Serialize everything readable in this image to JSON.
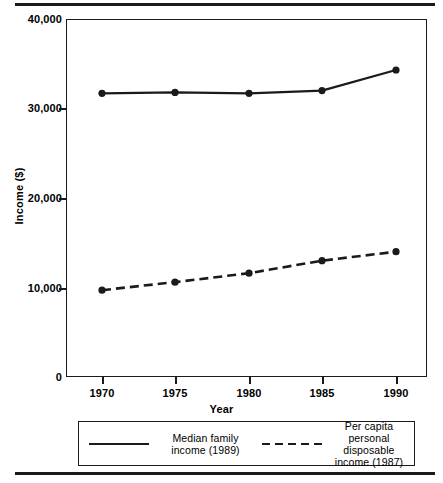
{
  "chart_data": {
    "type": "line",
    "title": "",
    "xlabel": "Year",
    "ylabel": "Income ($)",
    "x": [
      1970,
      1975,
      1980,
      1985,
      1990
    ],
    "xticklabels": [
      "1970",
      "1975",
      "1980",
      "1985",
      "1990"
    ],
    "yticklabels": [
      "0",
      "10,000",
      "20,000",
      "30,000",
      "40,000"
    ],
    "yticks": [
      0,
      10000,
      20000,
      30000,
      40000
    ],
    "ylim": [
      0,
      40000
    ],
    "xlim": [
      1968,
      1992
    ],
    "grid": false,
    "legend_position": "below-axes",
    "series": [
      {
        "name": "Median family income (1989)",
        "style": "solid",
        "marker": "circle",
        "values": [
          31700,
          31800,
          31700,
          32000,
          34300
        ]
      },
      {
        "name": "Per capita personal disposable income (1987)",
        "style": "dashed",
        "marker": "circle",
        "values": [
          9700,
          10600,
          11600,
          13000,
          14000
        ]
      }
    ]
  },
  "axes": {
    "y_title": "Income ($)",
    "x_title": "Year",
    "y_ticks": [
      {
        "label": "40,000",
        "value": 40000
      },
      {
        "label": "30,000",
        "value": 30000
      },
      {
        "label": "20,000",
        "value": 20000
      },
      {
        "label": "10,000",
        "value": 10000
      },
      {
        "label": "0",
        "value": 0
      }
    ],
    "x_ticks": [
      {
        "label": "1970",
        "value": 1970
      },
      {
        "label": "1975",
        "value": 1975
      },
      {
        "label": "1980",
        "value": 1980
      },
      {
        "label": "1985",
        "value": 1985
      },
      {
        "label": "1990",
        "value": 1990
      }
    ]
  },
  "legend": {
    "entries": [
      {
        "label_line_1": "Median family",
        "label_line_2": "income (1989)",
        "label_line_3": "",
        "style": "solid"
      },
      {
        "label_line_1": "Per capita",
        "label_line_2": "personal disposable",
        "label_line_3": "income (1987)",
        "style": "dashed"
      }
    ]
  },
  "colors": {
    "ink": "#1a1a1a",
    "background": "#ffffff"
  }
}
